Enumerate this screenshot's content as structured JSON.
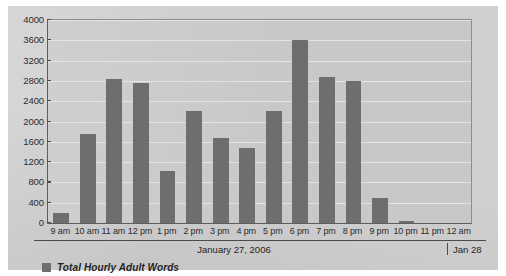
{
  "chart_data": {
    "type": "bar",
    "title": "",
    "subtitle": "",
    "xlabel": "January 27, 2006",
    "ylabel": "",
    "ylim": [
      0,
      4000
    ],
    "ytick_step": 400,
    "yticks": [
      "4000",
      "3600",
      "3200",
      "2800",
      "2400",
      "2000",
      "1600",
      "1200",
      "800",
      "400",
      "0"
    ],
    "grid": true,
    "legend_position": "bottom-left",
    "categories": [
      "9 am",
      "10 am",
      "11 am",
      "12 pm",
      "1 pm",
      "2 pm",
      "3 pm",
      "4 pm",
      "5 pm",
      "6 pm",
      "7 pm",
      "8 pm",
      "9 pm",
      "10 pm",
      "11 pm",
      "12 am"
    ],
    "series": [
      {
        "name": "Total Hourly Adult Words",
        "color": "#6e6e6e",
        "values": [
          190,
          1760,
          2830,
          2760,
          1030,
          2200,
          1670,
          1480,
          2200,
          3600,
          2880,
          2800,
          500,
          40,
          0,
          0
        ]
      }
    ],
    "annotations": {
      "date_primary": "January 27, 2006",
      "date_secondary": "Jan 28"
    }
  },
  "legend": {
    "swatch_name": "legend-color-swatch",
    "label": "Total Hourly Adult Words"
  },
  "colors": {
    "bar": "#6e6e6e",
    "panel_background": "#cfcfcf",
    "plot_background": "#c8c8c8",
    "gridline": "#e8e8e8",
    "axis": "#4b4b4b",
    "text": "#242424"
  }
}
